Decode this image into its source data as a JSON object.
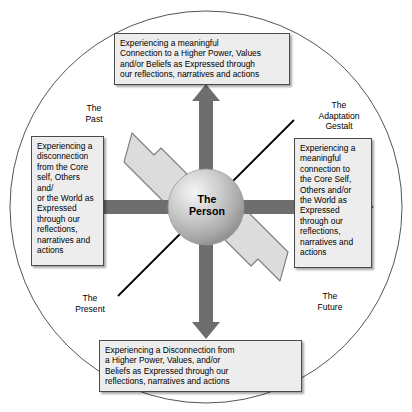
{
  "diagram": {
    "center": {
      "label": "The\nPerson",
      "name": "the-person-sphere"
    },
    "boxes": {
      "top": "Experiencing a meaningful\nConnection to a Higher Power, Values\nand/or Beliefs as Expressed through\nour reflections, narratives and actions",
      "left": "Experiencing a\ndisconnection\nfrom the Core\nself, Others and/\nor the World as\nExpressed\nthrough our\nreflections,\nnarratives and\nactions",
      "right": "Experiencing a\nmeaningful\nconnection to\nthe Core Self,\nOthers and/or\nthe World as\nExpressed\nthrough our\nreflections,\nnarratives and\nactions",
      "bottom": "Experiencing a Disconnection from\na Higher Power, Values, and/or\nBeliefs as Expressed through our\nreflections, narratives and actions"
    },
    "corner_labels": {
      "top_left": "The\nPast",
      "top_right": "The\nAdaptation\nGestalt",
      "bottom_left": "The\nPresent",
      "bottom_right": "The\nFuture"
    },
    "arrows": [
      {
        "name": "arrow-up",
        "direction": "up",
        "style": "dark"
      },
      {
        "name": "arrow-down",
        "direction": "down",
        "style": "dark"
      },
      {
        "name": "arrow-left",
        "direction": "left",
        "style": "dark"
      },
      {
        "name": "arrow-right",
        "direction": "right",
        "style": "dark"
      },
      {
        "name": "arrow-upper-left",
        "direction": "upper-left",
        "style": "light"
      },
      {
        "name": "arrow-lower-right",
        "direction": "lower-right",
        "style": "light"
      }
    ],
    "time_axis": {
      "name": "past-future-diagonal-line",
      "from": "The Present",
      "to": "The Adaptation Gestalt"
    },
    "colors": {
      "arrow_dark": "#6e6e6e",
      "arrow_light": "#dcdcdc",
      "arrow_light_border": "#808080",
      "box_fill": "#ededed",
      "box_border": "#4a4a4a",
      "circle_border": "#555555",
      "sphere_light": "#f2f2f2",
      "sphere_mid": "#b8b8b8",
      "sphere_dark": "#8a8a8a",
      "line": "#000000",
      "background": "#ffffff"
    }
  }
}
